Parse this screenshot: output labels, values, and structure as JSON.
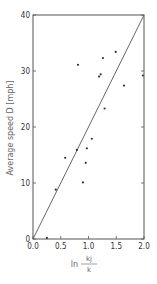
{
  "chart_data": {
    "type": "scatter",
    "title": "",
    "xlabel": "ln k_j / k",
    "xlabel_parts": {
      "prefix": "ln",
      "numerator": "kj",
      "denominator": "k"
    },
    "ylabel": "Average speed D  [mph]",
    "xlim": [
      0.0,
      2.0
    ],
    "ylim": [
      0,
      40
    ],
    "x_ticks": [
      "0.0",
      "0.5",
      "1.0",
      "1.5",
      "2.0"
    ],
    "x_tick_values": [
      0.0,
      0.5,
      1.0,
      1.5,
      2.0
    ],
    "y_ticks": [
      "0",
      "10",
      "20",
      "30",
      "40"
    ],
    "y_tick_values": [
      0,
      10,
      20,
      30,
      40
    ],
    "grid": false,
    "legend": null,
    "series": [
      {
        "name": "observations",
        "kind": "scatter",
        "points": [
          {
            "x": 0.25,
            "y": 0.2
          },
          {
            "x": 0.41,
            "y": 8.8
          },
          {
            "x": 0.58,
            "y": 14.5
          },
          {
            "x": 0.79,
            "y": 15.9
          },
          {
            "x": 0.81,
            "y": 31.1
          },
          {
            "x": 0.9,
            "y": 10.1
          },
          {
            "x": 0.95,
            "y": 13.6
          },
          {
            "x": 0.97,
            "y": 16.2
          },
          {
            "x": 1.06,
            "y": 17.9
          },
          {
            "x": 1.19,
            "y": 29.0
          },
          {
            "x": 1.22,
            "y": 29.4
          },
          {
            "x": 1.26,
            "y": 32.3
          },
          {
            "x": 1.29,
            "y": 23.3
          },
          {
            "x": 1.49,
            "y": 33.4
          },
          {
            "x": 1.64,
            "y": 27.4
          },
          {
            "x": 1.98,
            "y": 29.2
          }
        ]
      },
      {
        "name": "fitted line",
        "kind": "line",
        "points": [
          {
            "x": 0.0,
            "y": 0.0
          },
          {
            "x": 2.0,
            "y": 40.0
          }
        ]
      }
    ]
  },
  "colors": {
    "axis": "#555555",
    "line": "#555555",
    "point": "#333333",
    "text": "#555555"
  }
}
